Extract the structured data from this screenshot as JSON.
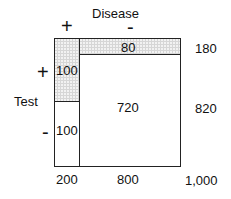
{
  "title": "Disease",
  "row_title": "Test",
  "col_signs": {
    "pos": "+",
    "neg": "-"
  },
  "row_signs": {
    "pos": "+",
    "neg": "-"
  },
  "cells": {
    "disease_pos_test_pos": "100",
    "disease_pos_test_neg": "100",
    "disease_neg_test_pos": "80",
    "disease_neg_test_neg": "720"
  },
  "row_totals": {
    "test_pos": "180",
    "test_neg": "820"
  },
  "col_totals": {
    "disease_pos": "200",
    "disease_neg": "800",
    "grand": "1,000"
  },
  "colors": {
    "stipple": "#d6d6d6",
    "line": "#222222"
  }
}
